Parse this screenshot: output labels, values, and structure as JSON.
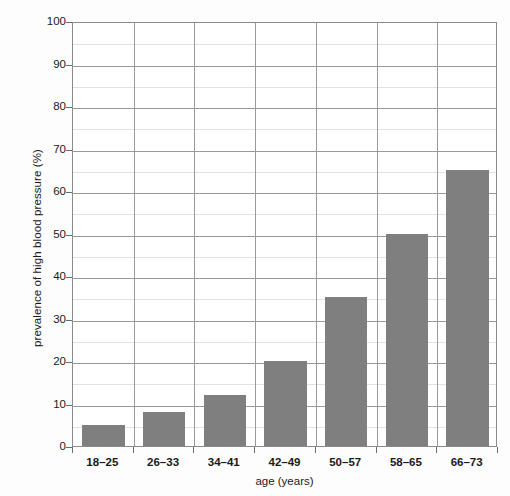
{
  "chart_data": {
    "type": "bar",
    "title": "",
    "subtitle": "",
    "xlabel": "age (years)",
    "ylabel": "prevalence of high blood pressure (%)",
    "categories": [
      "18–25",
      "26–33",
      "34–41",
      "42–49",
      "50–57",
      "58–65",
      "66–73"
    ],
    "values": [
      5,
      8,
      12,
      20,
      35,
      50,
      65
    ],
    "ylim": [
      0,
      100
    ],
    "y_major_ticks": [
      0,
      10,
      20,
      30,
      40,
      50,
      60,
      70,
      80,
      90,
      100
    ],
    "y_major_tick_labels": [
      "0",
      "10",
      "20",
      "30",
      "40",
      "50",
      "60",
      "70",
      "80",
      "90",
      "100"
    ],
    "y_minor_ticks": [
      5,
      15,
      25,
      35,
      45,
      55,
      65,
      75,
      85,
      95
    ],
    "grid": "horizontal major and minor, vertical category dividers",
    "legend": "none",
    "legend_position": "none",
    "bar_color": "#7f7f7f",
    "major_gridline_color": "#9a9a9a",
    "minor_gridline_color": "#e2e2e2",
    "frame_color": "#8a8a8a",
    "background_color": "#ffffff"
  }
}
